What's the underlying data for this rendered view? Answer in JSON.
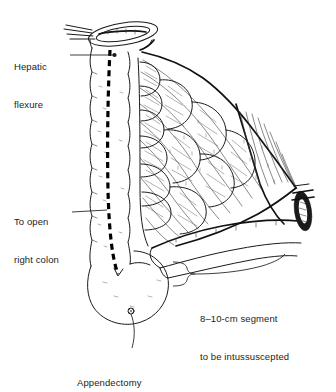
{
  "figure": {
    "background_color": "#ffffff",
    "ink_color": "#1a1a1a",
    "incision_line_color": "#000000"
  },
  "labels": {
    "hepatic_flexure": {
      "line1": "Hepatic",
      "line2": "flexure"
    },
    "to_open_right_colon": {
      "line1": "To open",
      "line2": "right colon"
    },
    "appendectomy": {
      "line1": "Appendectomy"
    },
    "segment": {
      "line1": "8–10-cm segment",
      "line2": "to be intussuscepted"
    }
  },
  "annotations": {
    "incision_line_name": "dashed-incision-line",
    "bracket_name": "segment-bracket",
    "leader_dot_name": "leader-endpoint-dot"
  },
  "anatomy": {
    "parts": [
      "ascending-colon",
      "hepatic-flexure-cut-end",
      "mesentery-fan",
      "epiploic-appendages",
      "cecum",
      "appendix-stump",
      "terminal-ileum",
      "bowel-clamp"
    ]
  }
}
